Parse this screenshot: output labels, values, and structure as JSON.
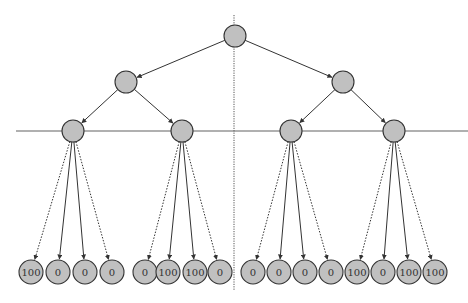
{
  "diagram": {
    "type": "tree",
    "colors": {
      "node_fill": "#c0c0c0",
      "node_stroke": "#333333",
      "edge": "#333333",
      "horizontal_line": "#b0b0b0",
      "vertical_line": "#555555"
    },
    "root": {
      "x": 235,
      "y": 36,
      "r": 11
    },
    "level1": [
      {
        "x": 126,
        "y": 82,
        "r": 11
      },
      {
        "x": 343,
        "y": 82,
        "r": 11
      }
    ],
    "level2": [
      {
        "x": 73,
        "y": 131,
        "r": 11,
        "parent": 0
      },
      {
        "x": 182,
        "y": 131,
        "r": 11,
        "parent": 0
      },
      {
        "x": 291,
        "y": 131,
        "r": 11,
        "parent": 1
      },
      {
        "x": 394,
        "y": 131,
        "r": 11,
        "parent": 1
      }
    ],
    "leaves": [
      {
        "x": 31,
        "value": "100",
        "parent": 0,
        "edge": "dotted"
      },
      {
        "x": 58,
        "value": "0",
        "parent": 0,
        "edge": "solid"
      },
      {
        "x": 85,
        "value": "0",
        "parent": 0,
        "edge": "solid"
      },
      {
        "x": 112,
        "value": "0",
        "parent": 0,
        "edge": "dotted"
      },
      {
        "x": 145,
        "value": "0",
        "parent": 1,
        "edge": "dotted"
      },
      {
        "x": 168,
        "value": "100",
        "parent": 1,
        "edge": "solid"
      },
      {
        "x": 195,
        "value": "100",
        "parent": 1,
        "edge": "solid"
      },
      {
        "x": 220,
        "value": "0",
        "parent": 1,
        "edge": "dotted"
      },
      {
        "x": 253,
        "value": "0",
        "parent": 2,
        "edge": "dotted"
      },
      {
        "x": 279,
        "value": "0",
        "parent": 2,
        "edge": "solid"
      },
      {
        "x": 305,
        "value": "0",
        "parent": 2,
        "edge": "solid"
      },
      {
        "x": 331,
        "value": "0",
        "parent": 2,
        "edge": "dotted"
      },
      {
        "x": 357,
        "value": "100",
        "parent": 3,
        "edge": "dotted"
      },
      {
        "x": 383,
        "value": "0",
        "parent": 3,
        "edge": "solid"
      },
      {
        "x": 409,
        "value": "100",
        "parent": 3,
        "edge": "solid"
      },
      {
        "x": 435,
        "value": "100",
        "parent": 3,
        "edge": "dotted"
      }
    ],
    "leaf_y": 272,
    "leaf_r": 12,
    "horizontal_line": {
      "x1": 16,
      "x2": 468,
      "y": 131
    },
    "vertical_line": {
      "x": 234,
      "y1": 15,
      "y2": 290
    }
  }
}
